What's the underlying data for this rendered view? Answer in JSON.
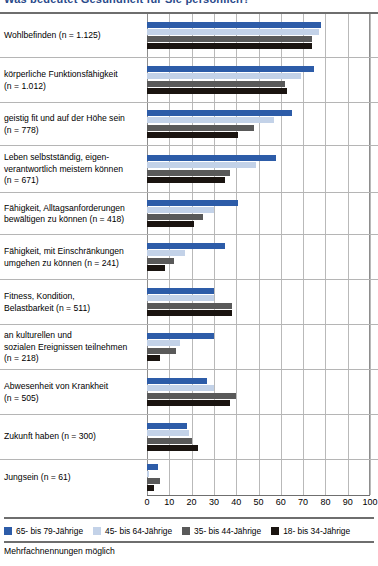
{
  "title": "Was bedeutet Gesundheit für Sie persönlich?",
  "footnote": "Mehrfachnennungen möglich",
  "colors": {
    "series_65_79": "#2d5ca8",
    "series_45_64": "#c3d2e8",
    "series_35_44": "#595959",
    "series_18_34": "#1a1410",
    "gridline": "#b9b9b9",
    "rowline": "#b5b5b5",
    "rule": "#6e6e6e",
    "title_text": "#2a4a8a"
  },
  "legend": {
    "position": "bottom",
    "items": [
      {
        "label": "65- bis 79-Jährige",
        "color": "#2d5ca8",
        "name": "legend-65-79"
      },
      {
        "label": "45- bis 64-Jährige",
        "color": "#c3d2e8",
        "name": "legend-45-64"
      },
      {
        "label": "35- bis 44-Jährige",
        "color": "#595959",
        "name": "legend-35-44"
      },
      {
        "label": "18- bis 34-Jährige",
        "color": "#1a1410",
        "name": "legend-18-34"
      }
    ]
  },
  "axis": {
    "ticks": [
      "0",
      "10",
      "20",
      "30",
      "40",
      "50",
      "60",
      "70",
      "80",
      "90",
      "100"
    ],
    "min": 0,
    "max": 100,
    "step": 10
  },
  "chart_data": {
    "type": "bar",
    "orientation": "horizontal",
    "title": "Was bedeutet Gesundheit für Sie persönlich?",
    "xlabel": "",
    "ylabel": "",
    "xlim": [
      0,
      100
    ],
    "grid": true,
    "legend_position": "bottom",
    "annotation": "Mehrfachnennungen möglich",
    "categories": [
      "Wohlbefinden (n = 1.125)",
      "körperliche Funktionsfähigkeit (n = 1.012)",
      "geistig fit und auf der Höhe sein (n = 778)",
      "Leben selbstständig, eigenverantwortlich meistern können (n = 671)",
      "Fähigkeit, Alltagsanforderungen bewältigen zu können (n = 418)",
      "Fähigkeit, mit Einschränkungen umgehen zu können (n = 241)",
      "Fitness, Kondition, Belastbarkeit (n = 511)",
      "an kulturellen und sozialen Ereignissen teilnehmen (n = 218)",
      "Abwesenheit von Krankheit (n = 505)",
      "Zukunft haben (n = 300)",
      "Jungsein (n = 61)"
    ],
    "series": [
      {
        "name": "65- bis 79-Jährige",
        "color": "#2d5ca8",
        "values": [
          78,
          75,
          65,
          58,
          41,
          35,
          30,
          30,
          27,
          18,
          5
        ]
      },
      {
        "name": "45- bis 64-Jährige",
        "color": "#c3d2e8",
        "values": [
          77,
          69,
          57,
          49,
          30,
          17,
          30,
          15,
          30,
          19,
          1
        ]
      },
      {
        "name": "35- bis 44-Jährige",
        "color": "#595959",
        "values": [
          74,
          62,
          48,
          37,
          25,
          12,
          38,
          13,
          40,
          20,
          6
        ]
      },
      {
        "name": "18- bis 34-Jährige",
        "color": "#1a1410",
        "values": [
          74,
          63,
          41,
          35,
          21,
          8,
          38,
          6,
          37,
          23,
          3
        ]
      }
    ]
  },
  "rows": [
    {
      "label": "Wohlbefinden (n = 1.125)",
      "height": 44
    },
    {
      "label": "körperliche Funktionsfähigkeit\n(n = 1.012)",
      "height": 45
    },
    {
      "label": "geistig fit und auf der Höhe sein\n(n = 778)",
      "height": 43
    },
    {
      "label": "Leben selbstständig, eigen-\nverantwortlich meistern können\n(n = 671)",
      "height": 47
    },
    {
      "label": "Fähigkeit, Alltagsanforderungen\nbewältigen zu können (n = 418)",
      "height": 42
    },
    {
      "label": "Fähigkeit, mit Einschränkungen\numgehen zu können (n = 241)",
      "height": 45
    },
    {
      "label": "Fitness, Kondition,\nBelastbarkeit (n = 511)",
      "height": 45
    },
    {
      "label": "an kulturellen und\nsozialen Ereignissen teilnehmen\n(n = 218)",
      "height": 45
    },
    {
      "label": "Abwesenheit von Krankheit\n(n = 505)",
      "height": 45
    },
    {
      "label": "Zukunft haben (n = 300)",
      "height": 45
    },
    {
      "label": "Jungsein (n = 61)",
      "height": 35
    }
  ]
}
